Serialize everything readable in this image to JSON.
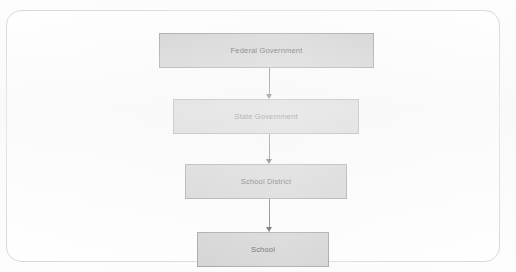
{
  "diagram": {
    "title": "",
    "orientation": "top-down",
    "frame": {
      "border_color": "#d6d6d6",
      "background_color": "#ffffff"
    },
    "node_style": {
      "fill_color": "#c9c9c9",
      "border_color": "#8e8e8e",
      "text_color": "#2b2b2b"
    },
    "connector_style": {
      "line_color": "#4a4a4a",
      "arrowhead_color": "#2e2e2e",
      "arrow_direction": "down"
    },
    "nodes": [
      {
        "id": "federal",
        "label": "Federal Government",
        "level": 1
      },
      {
        "id": "state",
        "label": "State Government",
        "level": 2
      },
      {
        "id": "district",
        "label": "School District",
        "level": 3
      },
      {
        "id": "school",
        "label": "School",
        "level": 4
      }
    ],
    "connectors": [
      {
        "from": "federal",
        "to": "state",
        "label": ""
      },
      {
        "from": "state",
        "to": "district",
        "label": ""
      },
      {
        "from": "district",
        "to": "school",
        "label": ""
      }
    ]
  }
}
